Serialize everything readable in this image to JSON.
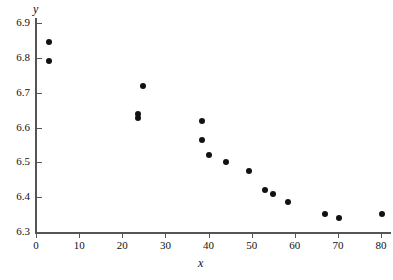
{
  "chart_data": {
    "type": "scatter",
    "title": "",
    "xlabel": "x",
    "ylabel": "y",
    "xlim": [
      0,
      82
    ],
    "ylim": [
      6.3,
      6.9
    ],
    "xticks": [
      0,
      10,
      20,
      30,
      40,
      50,
      60,
      70,
      80
    ],
    "xtick_labels": [
      "0",
      "10",
      "20",
      "30",
      "40",
      "50",
      "60",
      "70",
      "80"
    ],
    "yticks": [
      6.3,
      6.4,
      6.5,
      6.6,
      6.7,
      6.8,
      6.9
    ],
    "ytick_labels": [
      "6.3",
      "6.4",
      "6.5",
      "6.6",
      "6.7",
      "6.8",
      "6.9"
    ],
    "grid": false,
    "legend": false,
    "marker": "filled-circle",
    "marker_color": "#121212",
    "axis_color": "#555555",
    "background": "#ffffff",
    "points": [
      {
        "x": 3.0,
        "y": 6.845
      },
      {
        "x": 3.0,
        "y": 6.79
      },
      {
        "x": 24.7,
        "y": 6.72
      },
      {
        "x": 23.7,
        "y": 6.64
      },
      {
        "x": 23.7,
        "y": 6.628
      },
      {
        "x": 38.4,
        "y": 6.62
      },
      {
        "x": 38.4,
        "y": 6.565
      },
      {
        "x": 40.0,
        "y": 6.52
      },
      {
        "x": 44.0,
        "y": 6.5
      },
      {
        "x": 49.3,
        "y": 6.475
      },
      {
        "x": 53.0,
        "y": 6.42
      },
      {
        "x": 55.0,
        "y": 6.41
      },
      {
        "x": 58.4,
        "y": 6.385
      },
      {
        "x": 67.0,
        "y": 6.352
      },
      {
        "x": 70.3,
        "y": 6.34
      },
      {
        "x": 80.2,
        "y": 6.352
      }
    ]
  }
}
